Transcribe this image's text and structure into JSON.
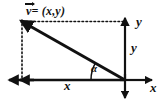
{
  "diagram": {
    "type": "vector-decomposition",
    "background_color": "#ffffff",
    "stroke_color": "#111111",
    "labels": {
      "vector_name": "v",
      "vector_equation": "= (x,y)",
      "vector_full": "v = (x,y)",
      "y_axis": "y",
      "y_component": "y",
      "x_axis": "x",
      "x_component": "x",
      "angle": "α"
    },
    "geometry": {
      "origin": {
        "x": 125,
        "y": 80
      },
      "vector_tip": {
        "x": 22,
        "y": 22
      },
      "x_axis_left_arrow": {
        "x": 8,
        "y": 80
      },
      "x_axis_right_arrow": {
        "x": 152,
        "y": 80
      },
      "y_axis_top_arrow": {
        "x": 125,
        "y": 16
      },
      "y_axis_bottom_arrow": {
        "x": 125,
        "y": 100
      },
      "angle_arc_radius": 34
    }
  }
}
